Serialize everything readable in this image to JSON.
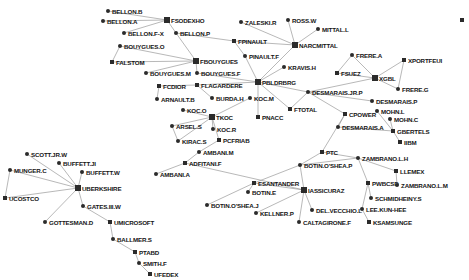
{
  "view": {
    "title": "Corporate ownership network graph",
    "width": 469,
    "height": 280,
    "background_color": "#ffffff",
    "node_color": "#2b2b2b",
    "edge_color": "#9a9a9a",
    "label_color": "#151515"
  },
  "chart_data": {
    "type": "scatter",
    "title": "",
    "xlabel": "",
    "ylabel": "",
    "layout": "force-directed node-link diagram",
    "grid": false,
    "legend": "none",
    "nodes": [
      {
        "id": "BELLON.B",
        "label": "BELLON.B",
        "x": 108,
        "y": 11,
        "shape": "circle",
        "hub": false
      },
      {
        "id": "FSODEXHO",
        "label": "FSODEXHO",
        "x": 167,
        "y": 20,
        "shape": "square",
        "hub": true
      },
      {
        "id": "BELLON.A",
        "label": "BELLON.A",
        "x": 103,
        "y": 21,
        "shape": "circle",
        "hub": false
      },
      {
        "id": "BELLON.F-X",
        "label": "BELLON.F-X",
        "x": 124,
        "y": 33,
        "shape": "circle",
        "hub": false
      },
      {
        "id": "BELLON.P",
        "label": "BELLON.P",
        "x": 176,
        "y": 33,
        "shape": "circle",
        "hub": false
      },
      {
        "id": "ZALESKI.R",
        "label": "ZALESKI.R",
        "x": 241,
        "y": 22,
        "shape": "circle",
        "hub": false
      },
      {
        "id": "ROSS.W",
        "label": "ROSS.W",
        "x": 288,
        "y": 20,
        "shape": "circle",
        "hub": false
      },
      {
        "id": "MITTAL.L",
        "label": "MITTAL.L",
        "x": 318,
        "y": 29,
        "shape": "circle",
        "hub": false
      },
      {
        "id": "FPINAULT",
        "label": "FPINAULT",
        "x": 234,
        "y": 41,
        "shape": "square",
        "hub": false
      },
      {
        "id": "NARCMITTAL",
        "label": "NARCMITTAL",
        "x": 295,
        "y": 45,
        "shape": "square",
        "hub": true
      },
      {
        "id": "PINAULT.F",
        "label": "PINAULT.F",
        "x": 245,
        "y": 56,
        "shape": "circle",
        "hub": false
      },
      {
        "id": "FRERE.A",
        "label": "FRERE.A",
        "x": 352,
        "y": 55,
        "shape": "circle",
        "hub": false
      },
      {
        "id": "BOUYGUES.O",
        "label": "BOUYGUES.O",
        "x": 120,
        "y": 46,
        "shape": "circle",
        "hub": false
      },
      {
        "id": "FALSTOM",
        "label": "FALSTOM",
        "x": 112,
        "y": 62,
        "shape": "square",
        "hub": false
      },
      {
        "id": "FBOUYGUES",
        "label": "FBOUYGUES",
        "x": 196,
        "y": 61,
        "shape": "square",
        "hub": true
      },
      {
        "id": "XPORTFEUI",
        "label": "XPORTFEUI",
        "x": 404,
        "y": 60,
        "shape": "square",
        "hub": false
      },
      {
        "id": "KRAVIS.H",
        "label": "KRAVIS.H",
        "x": 284,
        "y": 67,
        "shape": "circle",
        "hub": false
      },
      {
        "id": "FSUEZ",
        "label": "FSUEZ",
        "x": 337,
        "y": 73,
        "shape": "square",
        "hub": false
      },
      {
        "id": "XGBL",
        "label": "XGBL",
        "x": 375,
        "y": 78,
        "shape": "square",
        "hub": true
      },
      {
        "id": "BOUYGUES.M",
        "label": "BOUYGUES.M",
        "x": 146,
        "y": 73,
        "shape": "circle",
        "hub": false
      },
      {
        "id": "BOUYGUES.F",
        "label": "BOUYGUES.F",
        "x": 197,
        "y": 73,
        "shape": "circle",
        "hub": false
      },
      {
        "id": "FCDIOR",
        "label": "FCDIOR",
        "x": 159,
        "y": 86,
        "shape": "square",
        "hub": false
      },
      {
        "id": "FLAGARDERE",
        "label": "FLAGARDERE",
        "x": 197,
        "y": 85,
        "shape": "square",
        "hub": false
      },
      {
        "id": "PBLDRBRG",
        "label": "PBLDRBRG",
        "x": 258,
        "y": 82,
        "shape": "square",
        "hub": true
      },
      {
        "id": "FRERE.G",
        "label": "FRERE.G",
        "x": 398,
        "y": 89,
        "shape": "circle",
        "hub": false
      },
      {
        "id": "ARNAULT.B",
        "label": "ARNAULT.B",
        "x": 157,
        "y": 99,
        "shape": "circle",
        "hub": false
      },
      {
        "id": "BURDA.H",
        "label": "BURDA.H",
        "x": 212,
        "y": 98,
        "shape": "circle",
        "hub": false
      },
      {
        "id": "KOC.M",
        "label": "KOC.M",
        "x": 250,
        "y": 98,
        "shape": "circle",
        "hub": false
      },
      {
        "id": "DESMARAIS.JR.P",
        "label": "DESMARAIS.JR.P",
        "x": 308,
        "y": 92,
        "shape": "circle",
        "hub": false
      },
      {
        "id": "DESMARAIS.P",
        "label": "DESMARAIS.P",
        "x": 372,
        "y": 101,
        "shape": "circle",
        "hub": false
      },
      {
        "id": "KOC.O",
        "label": "KOC.O",
        "x": 183,
        "y": 110,
        "shape": "circle",
        "hub": false
      },
      {
        "id": "FTOTAL",
        "label": "FTOTAL",
        "x": 290,
        "y": 109,
        "shape": "square",
        "hub": false
      },
      {
        "id": "MOHN.L",
        "label": "MOHN.L",
        "x": 377,
        "y": 111,
        "shape": "circle",
        "hub": false
      },
      {
        "id": "TKOC",
        "label": "TKOC",
        "x": 212,
        "y": 117,
        "shape": "square",
        "hub": true
      },
      {
        "id": "PNACC",
        "label": "PNACC",
        "x": 258,
        "y": 117,
        "shape": "square",
        "hub": false
      },
      {
        "id": "CPOWER",
        "label": "CPOWER",
        "x": 345,
        "y": 114,
        "shape": "square",
        "hub": false
      },
      {
        "id": "MOHN.C",
        "label": "MOHN.C",
        "x": 390,
        "y": 119,
        "shape": "circle",
        "hub": false
      },
      {
        "id": "ARSEL.S",
        "label": "ARSEL.S",
        "x": 172,
        "y": 126,
        "shape": "circle",
        "hub": false
      },
      {
        "id": "KOC.R",
        "label": "KOC.R",
        "x": 213,
        "y": 129,
        "shape": "circle",
        "hub": false
      },
      {
        "id": "DESMARAIS.A",
        "label": "DESMARAIS.A",
        "x": 338,
        "y": 127,
        "shape": "circle",
        "hub": false
      },
      {
        "id": "GBERTELS",
        "label": "GBERTELS",
        "x": 393,
        "y": 131,
        "shape": "square",
        "hub": false
      },
      {
        "id": "KIRAC.S",
        "label": "KIRAC.S",
        "x": 178,
        "y": 141,
        "shape": "circle",
        "hub": false
      },
      {
        "id": "PCFRIAB",
        "label": "PCFRIAB",
        "x": 219,
        "y": 140,
        "shape": "square",
        "hub": false
      },
      {
        "id": "IIBM",
        "label": "IIBM",
        "x": 400,
        "y": 142,
        "shape": "square",
        "hub": false
      },
      {
        "id": "AMBANI.M",
        "label": "AMBANI.M",
        "x": 199,
        "y": 152,
        "shape": "circle",
        "hub": false
      },
      {
        "id": "PTC",
        "label": "PTC",
        "x": 322,
        "y": 152,
        "shape": "square",
        "hub": false
      },
      {
        "id": "ZAMBRANO.L.H",
        "label": "ZAMBRANO.L.H",
        "x": 358,
        "y": 158,
        "shape": "circle",
        "hub": false
      },
      {
        "id": "ADFITANI.F",
        "label": "ADFITANI.F",
        "x": 185,
        "y": 163,
        "shape": "square",
        "hub": false
      },
      {
        "id": "SCOTT.JR.W",
        "label": "SCOTT.JR.W",
        "x": 27,
        "y": 154,
        "shape": "circle",
        "hub": false
      },
      {
        "id": "BUFFETT.JI",
        "label": "BUFFETT.JI",
        "x": 59,
        "y": 163,
        "shape": "circle",
        "hub": false
      },
      {
        "id": "AMBANI.A",
        "label": "AMBANI.A",
        "x": 156,
        "y": 174,
        "shape": "circle",
        "hub": false
      },
      {
        "id": "BOTIN.O'SHEA.P",
        "label": "BOTIN.O'SHEA.P",
        "x": 300,
        "y": 165,
        "shape": "circle",
        "hub": false
      },
      {
        "id": "LLEMEX",
        "label": "LLEMEX",
        "x": 396,
        "y": 171,
        "shape": "square",
        "hub": false
      },
      {
        "id": "MUNGER.C",
        "label": "MUNGER.C",
        "x": 10,
        "y": 170,
        "shape": "circle",
        "hub": false
      },
      {
        "id": "BUFFETT.W",
        "label": "BUFFETT.W",
        "x": 82,
        "y": 172,
        "shape": "circle",
        "hub": false
      },
      {
        "id": "UBERKSHIRE",
        "label": "UBERKSHIRE",
        "x": 78,
        "y": 188,
        "shape": "square",
        "hub": true
      },
      {
        "id": "ESANTANDER",
        "label": "ESANTANDER",
        "x": 254,
        "y": 183,
        "shape": "square",
        "hub": false
      },
      {
        "id": "PWBCSD",
        "label": "PWBCSD",
        "x": 368,
        "y": 183,
        "shape": "square",
        "hub": false
      },
      {
        "id": "ZAMBRANO.L.M",
        "label": "ZAMBRANO.L.M",
        "x": 397,
        "y": 185,
        "shape": "circle",
        "hub": false
      },
      {
        "id": "IASSICURAZ",
        "label": "IASSICURAZ",
        "x": 304,
        "y": 190,
        "shape": "square",
        "hub": true
      },
      {
        "id": "UCOSTCO",
        "label": "UCOSTCO",
        "x": 5,
        "y": 198,
        "shape": "square",
        "hub": false
      },
      {
        "id": "BOTIN.E",
        "label": "BOTIN.E",
        "x": 248,
        "y": 192,
        "shape": "circle",
        "hub": false
      },
      {
        "id": "SCHMIDHEINY.S",
        "label": "SCHMIDHEINY.S",
        "x": 371,
        "y": 198,
        "shape": "circle",
        "hub": false
      },
      {
        "id": "GATES.III.W",
        "label": "GATES.III.W",
        "x": 83,
        "y": 206,
        "shape": "circle",
        "hub": false
      },
      {
        "id": "BOTIN.O'SHEA.J",
        "label": "BOTIN.O'SHEA.J",
        "x": 207,
        "y": 205,
        "shape": "circle",
        "hub": false
      },
      {
        "id": "DEL.VECCHIO.L",
        "label": "DEL.VECCHIO.L",
        "x": 312,
        "y": 210,
        "shape": "circle",
        "hub": false
      },
      {
        "id": "LEE.KUN-HEE",
        "label": "LEE.KUN-HEE",
        "x": 362,
        "y": 209,
        "shape": "circle",
        "hub": false
      },
      {
        "id": "KELLNER.P",
        "label": "KELLNER.P",
        "x": 256,
        "y": 213,
        "shape": "circle",
        "hub": false
      },
      {
        "id": "GOTTESMAN.D",
        "label": "GOTTESMAN.D",
        "x": 45,
        "y": 222,
        "shape": "circle",
        "hub": false
      },
      {
        "id": "UMICROSOFT",
        "label": "UMICROSOFT",
        "x": 110,
        "y": 222,
        "shape": "square",
        "hub": false
      },
      {
        "id": "CALTAGIRONE.F",
        "label": "CALTAGIRONE.F",
        "x": 299,
        "y": 222,
        "shape": "circle",
        "hub": false
      },
      {
        "id": "KSAMSUNGE",
        "label": "KSAMSUNGE",
        "x": 369,
        "y": 222,
        "shape": "square",
        "hub": false
      },
      {
        "id": "BALLMER.S",
        "label": "BALLMER.S",
        "x": 113,
        "y": 239,
        "shape": "circle",
        "hub": false
      },
      {
        "id": "PTABD",
        "label": "PTABD",
        "x": 135,
        "y": 252,
        "shape": "square",
        "hub": false
      },
      {
        "id": "SMITH.F",
        "label": "SMITH.F",
        "x": 139,
        "y": 263,
        "shape": "circle",
        "hub": false
      },
      {
        "id": "UFEDEX",
        "label": "UFEDEX",
        "x": 150,
        "y": 274,
        "shape": "square",
        "hub": false
      },
      {
        "id": "EDGE-MARK",
        "label": "",
        "x": 462,
        "y": 20,
        "shape": "square",
        "hub": false
      }
    ],
    "edges": [
      [
        "BELLON.B",
        "FSODEXHO"
      ],
      [
        "BELLON.A",
        "FSODEXHO"
      ],
      [
        "BELLON.F-X",
        "FSODEXHO"
      ],
      [
        "BELLON.P",
        "FSODEXHO"
      ],
      [
        "BELLON.P",
        "FPINAULT"
      ],
      [
        "BELLON.P",
        "FBOUYGUES"
      ],
      [
        "FPINAULT",
        "NARCMITTAL"
      ],
      [
        "FPINAULT",
        "PINAULT.F"
      ],
      [
        "ZALESKI.R",
        "NARCMITTAL"
      ],
      [
        "ROSS.W",
        "NARCMITTAL"
      ],
      [
        "MITTAL.L",
        "NARCMITTAL"
      ],
      [
        "PINAULT.F",
        "PBLDRBRG"
      ],
      [
        "NARCMITTAL",
        "PBLDRBRG"
      ],
      [
        "BOUYGUES.O",
        "FALSTOM"
      ],
      [
        "BOUYGUES.O",
        "FBOUYGUES"
      ],
      [
        "FALSTOM",
        "FBOUYGUES"
      ],
      [
        "FBOUYGUES",
        "BOUYGUES.F"
      ],
      [
        "BOUYGUES.M",
        "FBOUYGUES"
      ],
      [
        "FCDIOR",
        "FLAGARDERE"
      ],
      [
        "FCDIOR",
        "ARNAULT.B"
      ],
      [
        "FLAGARDERE",
        "BURDA.H"
      ],
      [
        "FLAGARDERE",
        "PBLDRBRG"
      ],
      [
        "BOUYGUES.F",
        "PBLDRBRG"
      ],
      [
        "KRAVIS.H",
        "PBLDRBRG"
      ],
      [
        "PBLDRBRG",
        "DESMARAIS.JR.P"
      ],
      [
        "PBLDRBRG",
        "FTOTAL"
      ],
      [
        "PBLDRBRG",
        "PNACC"
      ],
      [
        "FRERE.A",
        "FSUEZ"
      ],
      [
        "FRERE.A",
        "XGBL"
      ],
      [
        "FSUEZ",
        "XGBL"
      ],
      [
        "XGBL",
        "DESMARAIS.JR.P"
      ],
      [
        "XGBL",
        "FRERE.G"
      ],
      [
        "XPORTFEUI",
        "FRERE.G"
      ],
      [
        "XPORTFEUI",
        "XGBL"
      ],
      [
        "DESMARAIS.JR.P",
        "FTOTAL"
      ],
      [
        "DESMARAIS.JR.P",
        "CPOWER"
      ],
      [
        "DESMARAIS.JR.P",
        "DESMARAIS.P"
      ],
      [
        "CPOWER",
        "DESMARAIS.A"
      ],
      [
        "CPOWER",
        "PTC"
      ],
      [
        "MOHN.L",
        "GBERTELS"
      ],
      [
        "MOHN.C",
        "GBERTELS"
      ],
      [
        "DESMARAIS.A",
        "GBERTELS"
      ],
      [
        "GBERTELS",
        "IIBM"
      ],
      [
        "KOC.M",
        "TKOC"
      ],
      [
        "KOC.O",
        "TKOC"
      ],
      [
        "TKOC",
        "KOC.R"
      ],
      [
        "TKOC",
        "ARSEL.S"
      ],
      [
        "TKOC",
        "KIRAC.S"
      ],
      [
        "TKOC",
        "PCFRIAB"
      ],
      [
        "ARSEL.S",
        "KIRAC.S"
      ],
      [
        "PCFRIAB",
        "AMBANI.M"
      ],
      [
        "AMBANI.M",
        "ADFITANI.F"
      ],
      [
        "ADFITANI.F",
        "AMBANI.A"
      ],
      [
        "PTC",
        "ZAMBRANO.L.H"
      ],
      [
        "PTC",
        "BOTIN.O'SHEA.P"
      ],
      [
        "ZAMBRANO.L.H",
        "LLEMEX"
      ],
      [
        "ZAMBRANO.L.H",
        "PWBCSD"
      ],
      [
        "LLEMEX",
        "ZAMBRANO.L.M"
      ],
      [
        "PWBCSD",
        "SCHMIDHEINY.S"
      ],
      [
        "PWBCSD",
        "LEE.KUN-HEE"
      ],
      [
        "LEE.KUN-HEE",
        "KSAMSUNGE"
      ],
      [
        "BOTIN.O'SHEA.P",
        "ESANTANDER"
      ],
      [
        "BOTIN.O'SHEA.P",
        "IASSICURAZ"
      ],
      [
        "BOTIN.O'SHEA.P",
        "ZAMBRANO.L.H"
      ],
      [
        "ESANTANDER",
        "BOTIN.E"
      ],
      [
        "ESANTANDER",
        "BOTIN.O'SHEA.J"
      ],
      [
        "ESANTANDER",
        "IASSICURAZ"
      ],
      [
        "IASSICURAZ",
        "KELLNER.P"
      ],
      [
        "IASSICURAZ",
        "DEL.VECCHIO.L"
      ],
      [
        "IASSICURAZ",
        "CALTAGIRONE.F"
      ],
      [
        "IASSICURAZ",
        "ADFITANI.F"
      ],
      [
        "SCOTT.JR.W",
        "UBERKSHIRE"
      ],
      [
        "BUFFETT.JI",
        "UBERKSHIRE"
      ],
      [
        "BUFFETT.W",
        "UBERKSHIRE"
      ],
      [
        "MUNGER.C",
        "UBERKSHIRE"
      ],
      [
        "MUNGER.C",
        "UCOSTCO"
      ],
      [
        "UBERKSHIRE",
        "UCOSTCO"
      ],
      [
        "UBERKSHIRE",
        "GATES.III.W"
      ],
      [
        "UBERKSHIRE",
        "GOTTESMAN.D"
      ],
      [
        "GATES.III.W",
        "UMICROSOFT"
      ],
      [
        "UMICROSOFT",
        "BALLMER.S"
      ],
      [
        "BALLMER.S",
        "PTABD"
      ],
      [
        "PTABD",
        "SMITH.F"
      ],
      [
        "SMITH.F",
        "UFEDEX"
      ]
    ]
  }
}
